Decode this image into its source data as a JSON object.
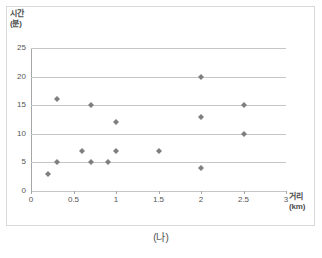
{
  "caption": "(나)",
  "marker_color": "#7f7f7f",
  "gridline_color": "#c6c6c6",
  "axis_color": "#a6a6a6",
  "chart_data": {
    "type": "scatter",
    "title": "",
    "subtitle": "",
    "xlabel": "거리\n(km)",
    "ylabel": "시간\n(분)",
    "xlim": [
      0,
      3
    ],
    "ylim": [
      0,
      25
    ],
    "xticks": [
      "0",
      "0.5",
      "1",
      "1.5",
      "2",
      "2.5",
      "3"
    ],
    "xtick_values": [
      0,
      0.5,
      1,
      1.5,
      2,
      2.5,
      3
    ],
    "yticks": [
      "0",
      "5",
      "10",
      "15",
      "20",
      "25"
    ],
    "ytick_values": [
      0,
      5,
      10,
      15,
      20,
      25
    ],
    "grid": "horizontal",
    "legend": "none",
    "series": [
      {
        "name": "거리-시간",
        "marker": "diamond",
        "color": "#7f7f7f",
        "points": [
          {
            "x": 0.2,
            "y": 3
          },
          {
            "x": 0.3,
            "y": 5
          },
          {
            "x": 0.3,
            "y": 16
          },
          {
            "x": 0.6,
            "y": 7
          },
          {
            "x": 0.7,
            "y": 5
          },
          {
            "x": 0.7,
            "y": 15
          },
          {
            "x": 0.9,
            "y": 5
          },
          {
            "x": 1.0,
            "y": 7
          },
          {
            "x": 1.0,
            "y": 12
          },
          {
            "x": 1.5,
            "y": 7
          },
          {
            "x": 2.0,
            "y": 4
          },
          {
            "x": 2.0,
            "y": 13
          },
          {
            "x": 2.0,
            "y": 20
          },
          {
            "x": 2.5,
            "y": 10
          },
          {
            "x": 2.5,
            "y": 15
          }
        ]
      }
    ]
  }
}
